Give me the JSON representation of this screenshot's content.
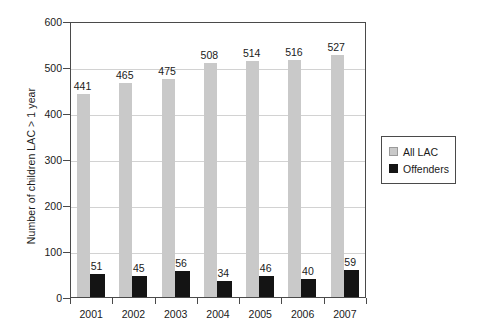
{
  "chart_data": {
    "type": "bar",
    "title": "",
    "subtitle": "",
    "xlabel": "",
    "ylabel": "Number of children LAC > 1 year",
    "categories": [
      "2001",
      "2002",
      "2003",
      "2004",
      "2005",
      "2006",
      "2007"
    ],
    "series": [
      {
        "name": "All LAC",
        "color": "#c9c9c9",
        "values": [
          441,
          465,
          475,
          508,
          514,
          516,
          527
        ]
      },
      {
        "name": "Offenders",
        "color": "#141414",
        "values": [
          51,
          45,
          56,
          34,
          46,
          40,
          59
        ]
      }
    ],
    "ylim": [
      0,
      600
    ],
    "ytick_labels": [
      "0",
      "100",
      "200",
      "300",
      "400",
      "500",
      "600"
    ],
    "ytick_values": [
      0,
      100,
      200,
      300,
      400,
      500,
      600
    ],
    "grid": true,
    "grid_axis": "y",
    "legend_position": "right",
    "data_labels_shown": true,
    "bar_mode": "grouped"
  },
  "legend": {
    "items": [
      {
        "label": "All LAC",
        "swatch": "all-lac-swatch"
      },
      {
        "label": "Offenders",
        "swatch": "offenders-swatch"
      }
    ]
  }
}
